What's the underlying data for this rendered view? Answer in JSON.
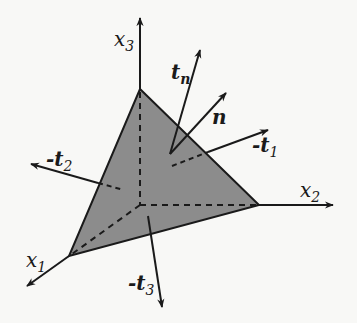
{
  "diagram": {
    "colors": {
      "face_fill": "#8c8c8c",
      "stroke": "#1a1a1a",
      "background": "#f8f8f6"
    },
    "axes": [
      {
        "id": "x1",
        "label": "x",
        "sub": "1"
      },
      {
        "id": "x2",
        "label": "x",
        "sub": "2"
      },
      {
        "id": "x3",
        "label": "x",
        "sub": "3"
      }
    ],
    "vectors": [
      {
        "id": "tn",
        "label": "t",
        "sub": "n",
        "prefix": ""
      },
      {
        "id": "n",
        "label": "n",
        "sub": "",
        "prefix": ""
      },
      {
        "id": "minus_t1",
        "label": "t",
        "sub": "1",
        "prefix": "-"
      },
      {
        "id": "minus_t2",
        "label": "t",
        "sub": "2",
        "prefix": "-"
      },
      {
        "id": "minus_t3",
        "label": "t",
        "sub": "3",
        "prefix": "-"
      }
    ]
  }
}
